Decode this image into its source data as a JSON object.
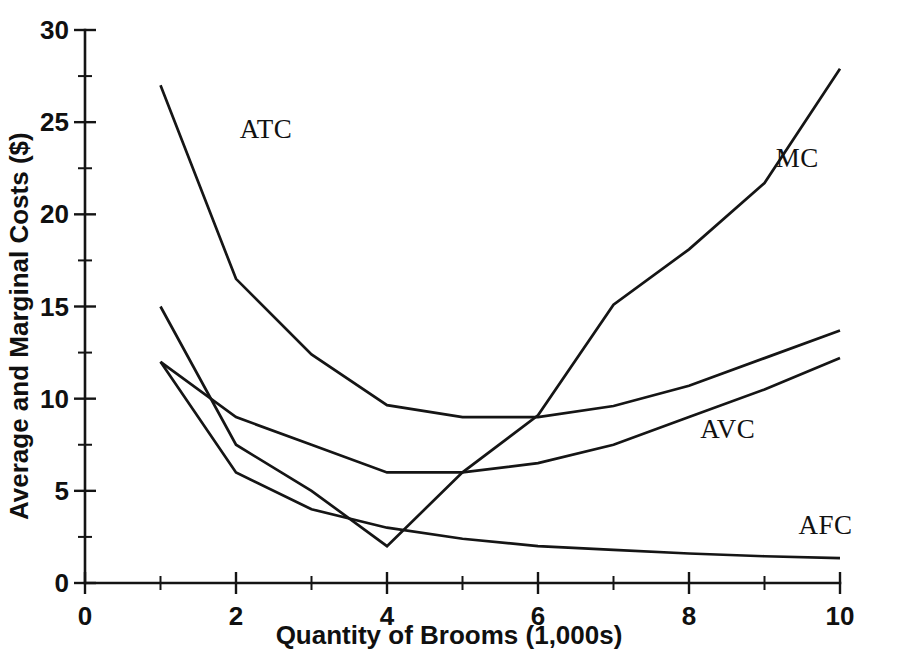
{
  "chart_data": {
    "type": "line",
    "title": "",
    "xlabel": "Quantity of Brooms (1,000s)",
    "ylabel": "Average and Marginal Costs ($)",
    "xlim": [
      0,
      10
    ],
    "ylim": [
      0,
      30
    ],
    "xticks": [
      0,
      1,
      2,
      3,
      4,
      5,
      6,
      7,
      8,
      9,
      10
    ],
    "xtick_labels": [
      "0",
      "",
      "2",
      "",
      "4",
      "",
      "6",
      "",
      "8",
      "",
      "10"
    ],
    "yticks": [
      0,
      2.5,
      5,
      7.5,
      10,
      12.5,
      15,
      17.5,
      20,
      22.5,
      25,
      27.5,
      30
    ],
    "ytick_labels": [
      "0",
      "",
      "5",
      "",
      "10",
      "",
      "15",
      "",
      "20",
      "",
      "25",
      "",
      "30"
    ],
    "grid": false,
    "legend": "inline-annotations",
    "x": [
      1,
      2,
      3,
      4,
      5,
      6,
      7,
      8,
      9,
      10
    ],
    "series": [
      {
        "name": "ATC",
        "label": "ATC",
        "label_x": 2.05,
        "label_y": 24.6,
        "values": [
          27.0,
          16.5,
          12.4,
          9.65,
          9.0,
          9.0,
          9.6,
          10.7,
          12.2,
          13.7
        ]
      },
      {
        "name": "MC",
        "label": "MC",
        "label_x": 9.15,
        "label_y": 23.0,
        "values": [
          15.0,
          7.5,
          5.0,
          2.0,
          6.0,
          9.1,
          15.1,
          18.1,
          21.7,
          27.9
        ]
      },
      {
        "name": "AVC",
        "label": "AVC",
        "label_x": 8.15,
        "label_y": 8.3,
        "values": [
          12.0,
          9.0,
          7.5,
          6.0,
          6.0,
          6.5,
          7.5,
          9.0,
          10.5,
          12.2
        ]
      },
      {
        "name": "AFC",
        "label": "AFC",
        "label_x": 9.45,
        "label_y": 3.1,
        "values": [
          12.0,
          6.0,
          4.0,
          3.0,
          2.4,
          2.0,
          1.8,
          1.6,
          1.45,
          1.35
        ]
      }
    ],
    "colors": {
      "axis": "#141414",
      "curve": "#151515",
      "background": "#ffffff"
    }
  }
}
